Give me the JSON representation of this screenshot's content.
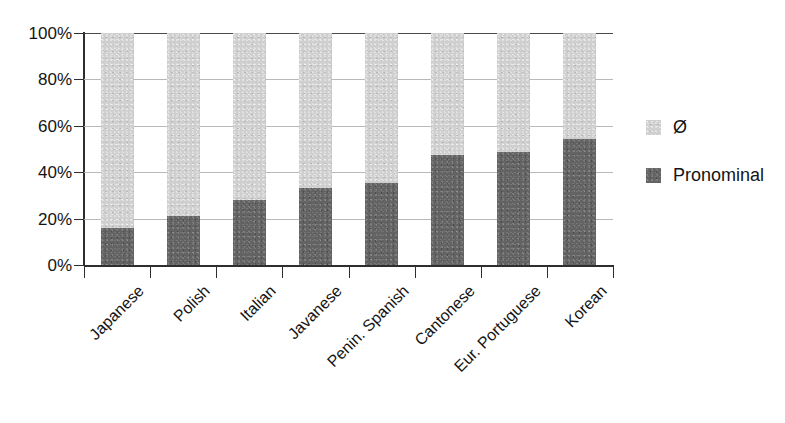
{
  "chart_data": {
    "type": "bar",
    "subtype": "stacked-percentage",
    "orientation": "vertical",
    "title": "",
    "subtitle": "",
    "xlabel": "",
    "ylabel": "",
    "ylim": [
      0,
      100
    ],
    "y_unit": "%",
    "grid": true,
    "grid_axis": "y",
    "legend_position": "right",
    "categories": [
      "Japanese",
      "Polish",
      "Italian",
      "Javanese",
      "Penin. Spanish",
      "Cantonese",
      "Eur. Portuguese",
      "Korean"
    ],
    "y_ticks": [
      0,
      20,
      40,
      60,
      80,
      100
    ],
    "y_tick_labels": [
      "0%",
      "20%",
      "40%",
      "60%",
      "80%",
      "100%"
    ],
    "series": [
      {
        "name": "Pronominal",
        "color": "#636363",
        "values": [
          16,
          21,
          28,
          33,
          35.5,
          47.5,
          48.5,
          54.5
        ]
      },
      {
        "name": "Ø",
        "color": "#cfcfcf",
        "values": [
          84,
          79,
          72,
          67,
          64.5,
          52.5,
          51.5,
          45.5
        ]
      }
    ]
  },
  "legend": {
    "items": [
      {
        "label": "Ø",
        "color": "#cfcfcf"
      },
      {
        "label": "Pronominal",
        "color": "#636363"
      }
    ]
  },
  "colors": {
    "zero_fill": "#cfcfcf",
    "pronominal_fill": "#636363",
    "axis": "#2e2e2e",
    "gridline": "#b9b9b9",
    "text": "#141414",
    "background": "#ffffff"
  }
}
